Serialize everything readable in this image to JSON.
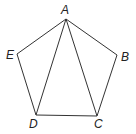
{
  "diagram": {
    "type": "geometry",
    "colors": {
      "stroke": "#333333",
      "label": "#222222",
      "background": "#ffffff"
    },
    "vertices": [
      {
        "name": "A",
        "x": 66,
        "y": 19,
        "label_x": 61,
        "label_y": 14
      },
      {
        "name": "B",
        "x": 117,
        "y": 55,
        "label_x": 121,
        "label_y": 61
      },
      {
        "name": "C",
        "x": 97,
        "y": 116,
        "label_x": 94,
        "label_y": 128
      },
      {
        "name": "D",
        "x": 36,
        "y": 115,
        "label_x": 29,
        "label_y": 128
      },
      {
        "name": "E",
        "x": 17,
        "y": 54,
        "label_x": 6,
        "label_y": 59
      }
    ],
    "edges": [
      [
        "A",
        "B"
      ],
      [
        "B",
        "C"
      ],
      [
        "C",
        "D"
      ],
      [
        "D",
        "E"
      ],
      [
        "E",
        "A"
      ],
      [
        "A",
        "D"
      ],
      [
        "A",
        "C"
      ]
    ],
    "labels": {
      "A": "A",
      "B": "B",
      "C": "C",
      "D": "D",
      "E": "E"
    }
  }
}
